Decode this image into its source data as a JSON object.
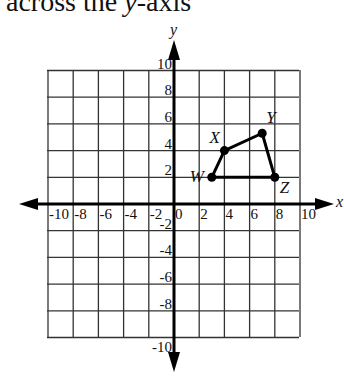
{
  "header": {
    "title_prefix": "across the ",
    "title_var": "y",
    "title_suffix": "-axis"
  },
  "chart_data": {
    "type": "scatter",
    "title": "across the y-axis",
    "xlabel": "x",
    "ylabel": "y",
    "xlim": [
      -10,
      10
    ],
    "ylim": [
      -10,
      10
    ],
    "grid": true,
    "grid_step": 2,
    "x_ticks": [
      "-10",
      "-8",
      "-6",
      "-4",
      "-2",
      "0",
      "2",
      "4",
      "6",
      "8",
      "10"
    ],
    "y_ticks": [
      "10",
      "8",
      "6",
      "4",
      "2",
      "-2",
      "-4",
      "-6",
      "-8",
      "-10"
    ],
    "polygon": {
      "name": "WXYZ",
      "closed": true,
      "points": [
        {
          "label": "W",
          "x": 3,
          "y": 2
        },
        {
          "label": "X",
          "x": 4,
          "y": 4
        },
        {
          "label": "Y",
          "x": 7,
          "y": 5.3
        },
        {
          "label": "Z",
          "x": 8,
          "y": 2
        }
      ]
    }
  }
}
